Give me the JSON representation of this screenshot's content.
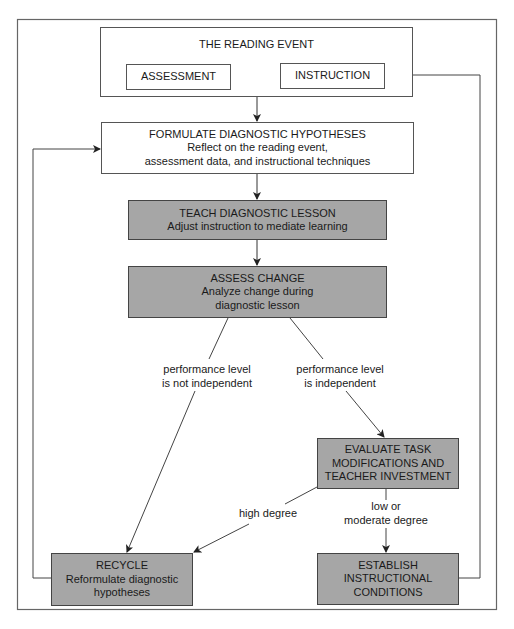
{
  "diagram": {
    "reading_event": {
      "title": "THE READING EVENT",
      "assessment": "ASSESSMENT",
      "instruction": "INSTRUCTION"
    },
    "formulate": {
      "title": "FORMULATE DIAGNOSTIC HYPOTHESES",
      "line1": "Reflect on the reading event,",
      "line2": "assessment data, and instructional techniques"
    },
    "teach": {
      "title": "TEACH DIAGNOSTIC LESSON",
      "line1": "Adjust instruction to mediate learning"
    },
    "assess_change": {
      "title": "ASSESS CHANGE",
      "line1": "Analyze change during",
      "line2": "diagnostic lesson"
    },
    "branch_labels": {
      "not_independent_1": "performance level",
      "not_independent_2": "is not independent",
      "independent_1": "performance level",
      "independent_2": "is independent",
      "high_degree": "high degree",
      "low_moderate_1": "low or",
      "low_moderate_2": "moderate degree"
    },
    "evaluate": {
      "line1": "EVALUATE TASK",
      "line2": "MODIFICATIONS AND",
      "line3": "TEACHER INVESTMENT"
    },
    "recycle": {
      "title": "RECYCLE",
      "line1": "Reformulate diagnostic",
      "line2": "hypotheses"
    },
    "establish": {
      "line1": "ESTABLISH",
      "line2": "INSTRUCTIONAL",
      "line3": "CONDITIONS"
    },
    "colors": {
      "gray_fill": "#a6a6a6",
      "line": "#444444"
    }
  }
}
